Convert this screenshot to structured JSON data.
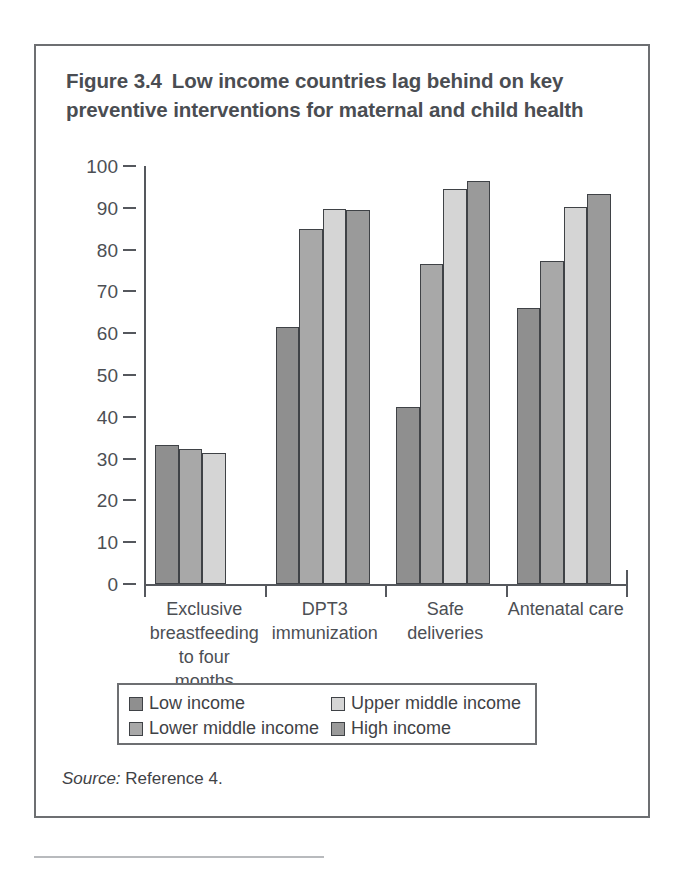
{
  "figure": {
    "number": "Figure 3.4",
    "title": "Low income countries lag behind on key preventive interventions for maternal and child health"
  },
  "source": {
    "label": "Source:",
    "value": "Reference 4."
  },
  "legend": {
    "entries": [
      {
        "label": "Low income",
        "color": "#8f8f8f"
      },
      {
        "label": "Upper middle income",
        "color": "#d5d5d5"
      },
      {
        "label": "Lower middle income",
        "color": "#a8a8a8"
      },
      {
        "label": "High income",
        "color": "#9a9a9a"
      }
    ]
  },
  "chart_data": {
    "type": "bar",
    "xlabel": "",
    "ylabel": "",
    "ylim": [
      0,
      100
    ],
    "yticks": [
      0,
      10,
      20,
      30,
      40,
      50,
      60,
      70,
      80,
      90,
      100
    ],
    "ytick_labels": [
      "0",
      "10",
      "20",
      "30",
      "40",
      "50",
      "60",
      "70",
      "80",
      "90",
      "100"
    ],
    "grid": false,
    "legend_position": "below-plot",
    "categories": [
      "Exclusive breastfeeding to four months",
      "DPT3 immunization",
      "Safe deliveries",
      "Antenatal care"
    ],
    "category_label_lines": [
      [
        "Exclusive",
        "breastfeeding",
        "to four",
        "months"
      ],
      [
        "DPT3",
        "immunization"
      ],
      [
        "Safe",
        "deliveries"
      ],
      [
        "Antenatal care"
      ]
    ],
    "series": [
      {
        "name": "Low income",
        "color": "#8f8f8f",
        "values": [
          33.2,
          61.5,
          42.3,
          66.0
        ]
      },
      {
        "name": "Lower middle income",
        "color": "#a8a8a8",
        "values": [
          32.2,
          85.0,
          76.5,
          77.3
        ]
      },
      {
        "name": "Upper middle income",
        "color": "#d5d5d5",
        "values": [
          31.4,
          89.8,
          94.5,
          90.3
        ]
      },
      {
        "name": "High income",
        "color": "#9a9a9a",
        "values": [
          null,
          89.5,
          96.3,
          93.3
        ]
      }
    ]
  }
}
